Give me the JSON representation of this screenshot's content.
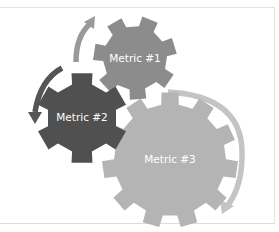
{
  "diagram": {
    "type": "gear-cycle",
    "gears": [
      {
        "id": "metric-1",
        "label": "Metric #1",
        "color": "#8c8c8c",
        "cx": 135,
        "cy": 58,
        "teeth": 7
      },
      {
        "id": "metric-2",
        "label": "Metric #2",
        "color": "#505050",
        "cx": 82,
        "cy": 118,
        "teeth": 6
      },
      {
        "id": "metric-3",
        "label": "Metric #3",
        "color": "#b4b4b4",
        "cx": 170,
        "cy": 160,
        "teeth": 11
      }
    ],
    "arrows": [
      {
        "id": "arrow-top",
        "color": "#999999",
        "direction": "up"
      },
      {
        "id": "arrow-left",
        "color": "#555555",
        "direction": "down"
      },
      {
        "id": "arrow-right",
        "color": "#c4c4c4",
        "direction": "down"
      }
    ]
  }
}
